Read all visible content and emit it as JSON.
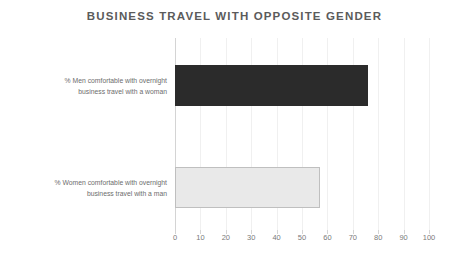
{
  "chart_data": {
    "type": "bar",
    "orientation": "horizontal",
    "title": "BUSINESS TRAVEL WITH OPPOSITE GENDER",
    "xlabel": "",
    "ylabel": "",
    "xlim": [
      0,
      100
    ],
    "grid": true,
    "legend": "none",
    "categories": [
      "% Men comfortable with overnight business travel with a woman",
      "% Women comfortable with overnight business travel with a man"
    ],
    "category_lines": [
      [
        "% Men comfortable with overnight",
        "business travel with a woman"
      ],
      [
        "% Women comfortable with overnight",
        "business travel with a man"
      ]
    ],
    "values": [
      76,
      57
    ],
    "bar_colors": [
      "#2b2b2b",
      "#e9e9e9"
    ],
    "xticks": [
      0,
      10,
      20,
      30,
      40,
      50,
      60,
      70,
      80,
      90,
      100
    ],
    "xtick_labels": [
      "0",
      "10",
      "20",
      "30",
      "40",
      "50",
      "60",
      "70",
      "80",
      "90",
      "100"
    ]
  },
  "style": {
    "title_color": "#5b5b5b",
    "tick_color": "#7a7a7a",
    "label_color": "#6d6d6d",
    "gridline_color": "#f0f0f0",
    "axis_color": "#d4d4d4",
    "background": "#ffffff"
  }
}
